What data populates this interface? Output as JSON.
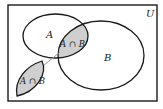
{
  "diagram": {
    "type": "venn",
    "universe_label": "U",
    "sets": [
      {
        "label": "A"
      },
      {
        "label": "B"
      }
    ],
    "intersection_label": "A ∩ B",
    "callout_label": "A ∩ B",
    "colors": {
      "stroke": "#1a1a1a",
      "shade": "#cfcfcf",
      "connector": "#9a9a9a",
      "background": "#ffffff"
    }
  }
}
